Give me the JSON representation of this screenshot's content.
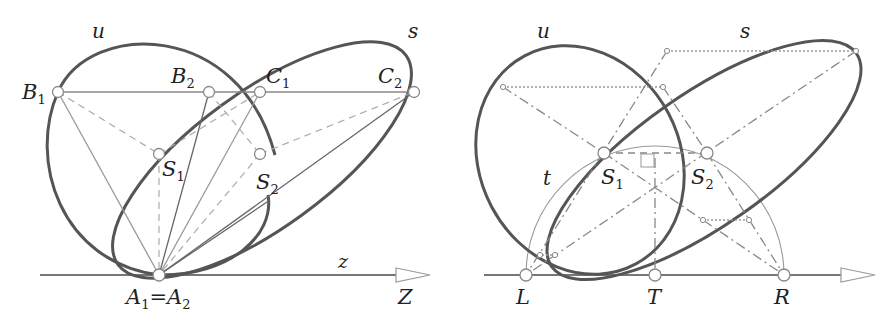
{
  "figure": {
    "left_panel": {
      "curves": {
        "u": "u",
        "s": "s"
      },
      "axis": {
        "lower": "z",
        "upper": "Z"
      },
      "points": {
        "B1": {
          "base": "B",
          "sub": "1"
        },
        "B2": {
          "base": "B",
          "sub": "2"
        },
        "C1": {
          "base": "C",
          "sub": "1"
        },
        "C2": {
          "base": "C",
          "sub": "2"
        },
        "S1": {
          "base": "S",
          "sub": "1"
        },
        "S2": {
          "base": "S",
          "sub": "2"
        },
        "A1": {
          "base": "A",
          "sub": "1"
        },
        "eq": "=",
        "A2": {
          "base": "A",
          "sub": "2"
        }
      }
    },
    "right_panel": {
      "curves": {
        "u": "u",
        "s": "s",
        "t": "t"
      },
      "points": {
        "S1": {
          "base": "S",
          "sub": "1"
        },
        "S2": {
          "base": "S",
          "sub": "2"
        },
        "L": "L",
        "T": "T",
        "R": "R"
      }
    },
    "colors": {
      "curve": "#555555",
      "line": "#777777",
      "light_line": "#aaaaaa",
      "text": "#222222"
    }
  }
}
